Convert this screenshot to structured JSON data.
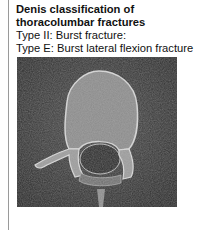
{
  "heading": "Denis classification of thoracolumbar fractures",
  "lines": [
    "Type II: Burst fracture:",
    "Type E: Burst lateral flexion fracture"
  ]
}
